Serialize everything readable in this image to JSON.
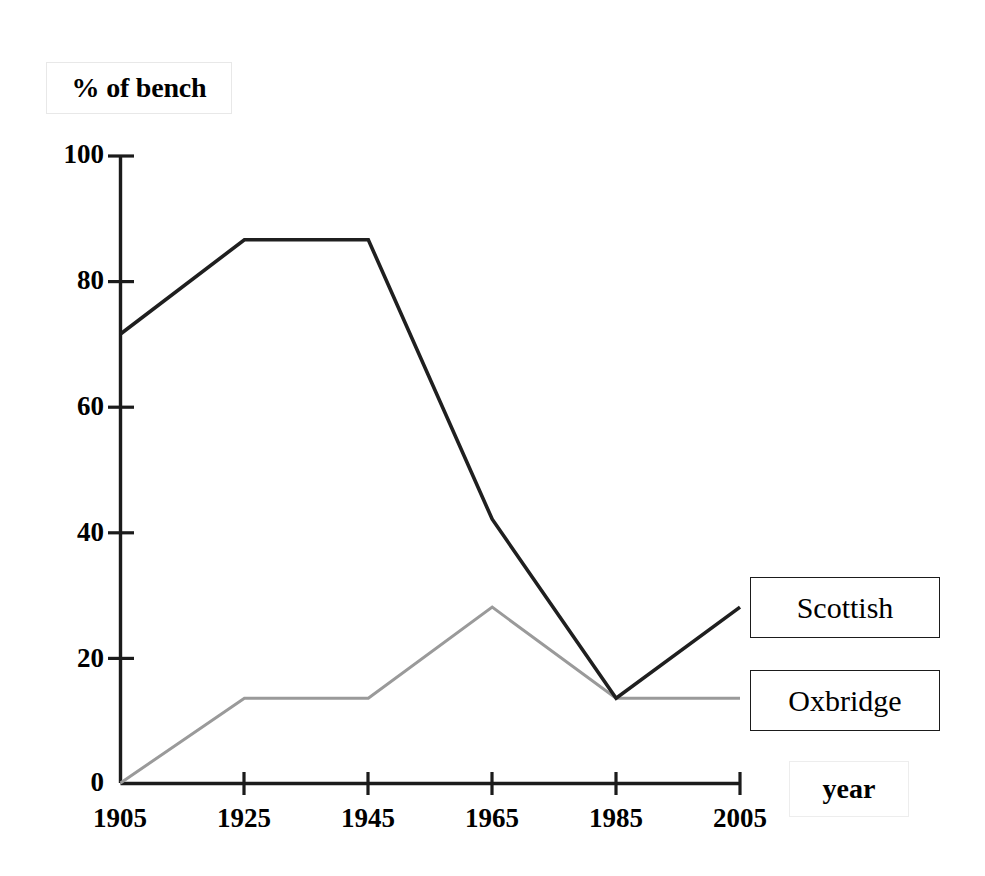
{
  "chart_data": {
    "type": "line",
    "title": "",
    "xlabel": "year",
    "ylabel": "% of bench",
    "x": [
      1905,
      1925,
      1945,
      1965,
      1985,
      2005
    ],
    "xtick_labels": [
      "1905",
      "1925",
      "1945",
      "1965",
      "1985",
      "2005"
    ],
    "ytick_labels": [
      "0",
      "20",
      "40",
      "60",
      "80",
      "100"
    ],
    "yticks": [
      0,
      20,
      40,
      60,
      80,
      100
    ],
    "ylim": [
      0,
      100
    ],
    "xlim": [
      1905,
      2005
    ],
    "grid": false,
    "legend_position": "right",
    "series": [
      {
        "name": "Oxbridge",
        "color": "#1f1f1f",
        "values": [
          71.5,
          86.5,
          86.5,
          42,
          13.5,
          28
        ]
      },
      {
        "name": "Scottish",
        "color": "#9a9a9a",
        "values": [
          0,
          13.5,
          13.5,
          28,
          13.5,
          13.5
        ]
      }
    ]
  },
  "legend": {
    "scottish_label": "Scottish",
    "oxbridge_label": "Oxbridge"
  },
  "axis_titles": {
    "y": "% of bench",
    "x": "year"
  }
}
